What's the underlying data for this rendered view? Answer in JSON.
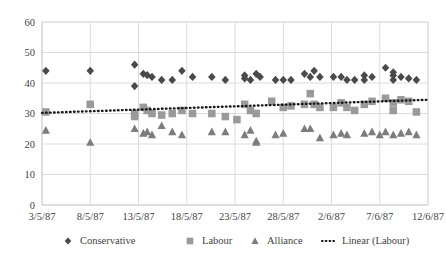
{
  "chart_data": {
    "type": "scatter",
    "title": "",
    "xlabel": "",
    "ylabel": "",
    "ylim": [
      0,
      60
    ],
    "yticks": [
      0,
      10,
      20,
      30,
      40,
      50,
      60
    ],
    "xticks": [
      "3/5/87",
      "8/5/87",
      "13/5/87",
      "18/5/87",
      "23/5/87",
      "28/5/87",
      "2/6/87",
      "7/6/87",
      "12/6/87"
    ],
    "xtick_days": [
      0,
      5,
      10,
      15,
      20,
      25,
      30,
      35,
      40
    ],
    "xlim_days": [
      0,
      40
    ],
    "grid": true,
    "legend_position": "bottom",
    "series": [
      {
        "name": "Conservative",
        "marker": "diamond",
        "color": "#4a4a4a",
        "points": [
          [
            0.4,
            44.0
          ],
          [
            5.0,
            44.0
          ],
          [
            9.6,
            46.0
          ],
          [
            9.6,
            39.0
          ],
          [
            10.5,
            43.0
          ],
          [
            10.9,
            42.6
          ],
          [
            11.4,
            42.0
          ],
          [
            12.4,
            41.0
          ],
          [
            13.5,
            41.0
          ],
          [
            14.5,
            44.0
          ],
          [
            15.6,
            42.0
          ],
          [
            17.6,
            42.0
          ],
          [
            19.0,
            41.0
          ],
          [
            21.0,
            41.5
          ],
          [
            21.0,
            42.5
          ],
          [
            21.6,
            41.0
          ],
          [
            22.2,
            43.0
          ],
          [
            22.6,
            42.0
          ],
          [
            24.2,
            41.0
          ],
          [
            25.0,
            41.0
          ],
          [
            25.8,
            41.0
          ],
          [
            27.2,
            43.0
          ],
          [
            27.8,
            42.0
          ],
          [
            28.2,
            44.0
          ],
          [
            28.8,
            42.0
          ],
          [
            30.2,
            42.0
          ],
          [
            31.0,
            42.0
          ],
          [
            31.6,
            41.0
          ],
          [
            32.4,
            41.0
          ],
          [
            33.4,
            42.5
          ],
          [
            33.4,
            41.0
          ],
          [
            34.2,
            42.0
          ],
          [
            35.6,
            45.0
          ],
          [
            36.4,
            42.5
          ],
          [
            36.4,
            41.0
          ],
          [
            36.4,
            43.5
          ],
          [
            37.2,
            42.0
          ],
          [
            38.0,
            41.5
          ],
          [
            38.8,
            41.0
          ]
        ]
      },
      {
        "name": "Labour",
        "marker": "square",
        "color": "#9a9a9a",
        "points": [
          [
            0.4,
            30.5
          ],
          [
            5.0,
            33.0
          ],
          [
            9.6,
            30.0
          ],
          [
            9.6,
            29.0
          ],
          [
            10.5,
            32.0
          ],
          [
            10.9,
            31.0
          ],
          [
            11.4,
            30.0
          ],
          [
            12.4,
            29.5
          ],
          [
            13.5,
            30.0
          ],
          [
            14.5,
            31.0
          ],
          [
            15.6,
            30.0
          ],
          [
            17.6,
            30.0
          ],
          [
            19.0,
            29.0
          ],
          [
            20.2,
            28.0
          ],
          [
            21.0,
            33.0
          ],
          [
            21.6,
            31.0
          ],
          [
            22.2,
            30.0
          ],
          [
            23.8,
            34.0
          ],
          [
            25.0,
            32.0
          ],
          [
            25.8,
            32.5
          ],
          [
            27.2,
            33.0
          ],
          [
            27.8,
            36.5
          ],
          [
            28.2,
            33.0
          ],
          [
            28.8,
            32.0
          ],
          [
            30.2,
            32.0
          ],
          [
            31.0,
            33.5
          ],
          [
            31.6,
            32.0
          ],
          [
            32.4,
            31.0
          ],
          [
            33.4,
            33.0
          ],
          [
            34.2,
            34.0
          ],
          [
            35.6,
            35.0
          ],
          [
            36.4,
            33.5
          ],
          [
            36.4,
            31.0
          ],
          [
            37.2,
            34.5
          ],
          [
            38.0,
            34.0
          ],
          [
            38.8,
            30.5
          ]
        ]
      },
      {
        "name": "Alliance",
        "marker": "triangle",
        "color": "#7d7d7d",
        "points": [
          [
            0.4,
            24.5
          ],
          [
            5.0,
            20.5
          ],
          [
            9.6,
            25.0
          ],
          [
            10.5,
            23.5
          ],
          [
            10.9,
            24.0
          ],
          [
            11.4,
            23.0
          ],
          [
            12.4,
            26.0
          ],
          [
            13.5,
            24.0
          ],
          [
            14.5,
            23.0
          ],
          [
            17.6,
            24.0
          ],
          [
            19.0,
            24.0
          ],
          [
            21.0,
            23.0
          ],
          [
            21.6,
            24.5
          ],
          [
            22.2,
            21.0
          ],
          [
            22.2,
            20.5
          ],
          [
            24.2,
            23.0
          ],
          [
            25.0,
            23.5
          ],
          [
            27.2,
            25.0
          ],
          [
            27.8,
            25.0
          ],
          [
            28.8,
            22.0
          ],
          [
            30.2,
            23.0
          ],
          [
            31.0,
            23.5
          ],
          [
            31.6,
            23.0
          ],
          [
            33.4,
            23.5
          ],
          [
            34.2,
            24.0
          ],
          [
            35.0,
            23.0
          ],
          [
            35.6,
            24.0
          ],
          [
            36.4,
            23.0
          ],
          [
            37.2,
            23.5
          ],
          [
            38.0,
            24.0
          ],
          [
            38.8,
            23.0
          ]
        ]
      }
    ],
    "trendline": {
      "name": "Linear (Labour)",
      "style": "dotted",
      "color": "#1a1a1a",
      "x_start_day": 0,
      "x_end_day": 40,
      "y_start": 30.2,
      "y_end": 34.5
    }
  },
  "legend": {
    "items": [
      {
        "label": "Conservative",
        "marker": "diamond",
        "color": "#4a4a4a"
      },
      {
        "label": "Labour",
        "marker": "square",
        "color": "#9a9a9a"
      },
      {
        "label": "Alliance",
        "marker": "triangle",
        "color": "#7d7d7d"
      },
      {
        "label": "Linear (Labour)",
        "marker": "dotted-line",
        "color": "#1a1a1a"
      }
    ]
  }
}
